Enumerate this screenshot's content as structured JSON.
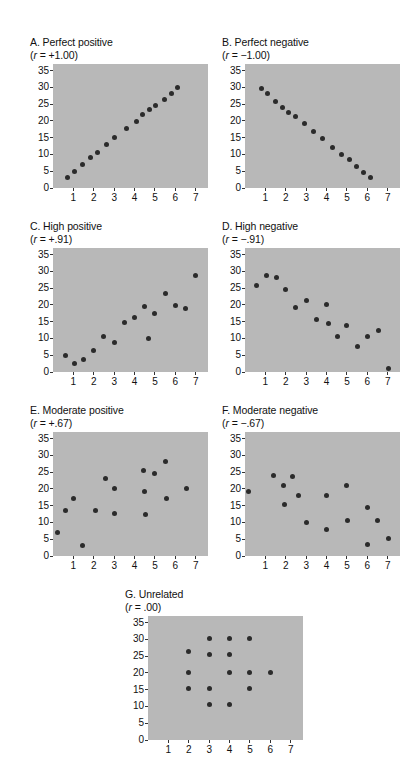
{
  "figure": {
    "background_color": "#ffffff",
    "plot_background_color": "#b8b8b8",
    "dot_color": "#2b2b2b",
    "axis_color": "#333333"
  },
  "chart_data": [
    {
      "type": "scatter",
      "id": "A",
      "title": "A. Perfect positive",
      "subtitle_prefix": "(",
      "subtitle_var": "r",
      "subtitle_rest": " = +1.00)",
      "correlation": "+1.00",
      "xlabel": "",
      "ylabel": "",
      "xlim": [
        0,
        7.6
      ],
      "ylim": [
        0,
        37
      ],
      "xticks": [
        1,
        2,
        3,
        4,
        5,
        6,
        7
      ],
      "yticks": [
        0,
        5,
        10,
        15,
        20,
        25,
        30,
        35
      ],
      "grid": false,
      "points": [
        [
          0.7,
          3.0
        ],
        [
          1.05,
          5.0
        ],
        [
          1.45,
          7.0
        ],
        [
          1.85,
          9.2
        ],
        [
          2.2,
          10.6
        ],
        [
          2.6,
          13.0
        ],
        [
          3.0,
          15.1
        ],
        [
          3.6,
          17.7
        ],
        [
          4.1,
          19.8
        ],
        [
          4.4,
          21.8
        ],
        [
          4.75,
          23.4
        ],
        [
          5.05,
          24.7
        ],
        [
          5.45,
          26.5
        ],
        [
          5.8,
          28.3
        ],
        [
          6.1,
          30.0
        ]
      ]
    },
    {
      "type": "scatter",
      "id": "B",
      "title": "B. Perfect negative",
      "subtitle_prefix": "(",
      "subtitle_var": "r",
      "subtitle_rest": " = −1.00)",
      "correlation": "-1.00",
      "xlabel": "",
      "ylabel": "",
      "xlim": [
        0,
        7.6
      ],
      "ylim": [
        0,
        37
      ],
      "xticks": [
        1,
        2,
        3,
        4,
        5,
        6,
        7
      ],
      "yticks": [
        0,
        5,
        10,
        15,
        20,
        25,
        30,
        35
      ],
      "grid": false,
      "points": [
        [
          0.8,
          29.6
        ],
        [
          1.1,
          28.1
        ],
        [
          1.5,
          25.8
        ],
        [
          1.85,
          24.0
        ],
        [
          2.15,
          22.6
        ],
        [
          2.5,
          21.2
        ],
        [
          2.9,
          19.2
        ],
        [
          3.35,
          16.8
        ],
        [
          3.8,
          14.7
        ],
        [
          4.3,
          12.0
        ],
        [
          4.75,
          10.0
        ],
        [
          5.1,
          8.4
        ],
        [
          5.45,
          6.5
        ],
        [
          5.8,
          4.5
        ],
        [
          6.15,
          3.0
        ]
      ]
    },
    {
      "type": "scatter",
      "id": "C",
      "title": "C. High positive",
      "subtitle_prefix": "(",
      "subtitle_var": "r",
      "subtitle_rest": " = +.91)",
      "correlation": "+.91",
      "xlabel": "",
      "ylabel": "",
      "xlim": [
        0,
        7.6
      ],
      "ylim": [
        0,
        37
      ],
      "xticks": [
        1,
        2,
        3,
        4,
        5,
        6,
        7
      ],
      "yticks": [
        0,
        5,
        10,
        15,
        20,
        25,
        30,
        35
      ],
      "grid": false,
      "points": [
        [
          0.6,
          5.0
        ],
        [
          1.05,
          2.6
        ],
        [
          1.5,
          3.6
        ],
        [
          2.0,
          6.5
        ],
        [
          2.5,
          10.5
        ],
        [
          3.0,
          8.9
        ],
        [
          3.5,
          14.9
        ],
        [
          4.0,
          16.2
        ],
        [
          4.5,
          19.4
        ],
        [
          4.7,
          9.9
        ],
        [
          5.0,
          17.4
        ],
        [
          5.5,
          23.5
        ],
        [
          6.0,
          19.8
        ],
        [
          6.5,
          18.9
        ],
        [
          7.0,
          28.9
        ]
      ]
    },
    {
      "type": "scatter",
      "id": "D",
      "title": "D. High negative",
      "subtitle_prefix": "(",
      "subtitle_var": "r",
      "subtitle_rest": " = −.91)",
      "correlation": "-.91",
      "xlabel": "",
      "ylabel": "",
      "xlim": [
        0,
        7.6
      ],
      "ylim": [
        0,
        37
      ],
      "xticks": [
        1,
        2,
        3,
        4,
        5,
        6,
        7
      ],
      "yticks": [
        0,
        5,
        10,
        15,
        20,
        25,
        30,
        35
      ],
      "grid": false,
      "points": [
        [
          0.55,
          25.9
        ],
        [
          1.05,
          28.9
        ],
        [
          1.55,
          28.3
        ],
        [
          2.0,
          24.7
        ],
        [
          2.5,
          19.3
        ],
        [
          3.0,
          21.4
        ],
        [
          3.5,
          15.8
        ],
        [
          4.0,
          20.1
        ],
        [
          4.1,
          14.5
        ],
        [
          4.55,
          10.6
        ],
        [
          5.0,
          13.8
        ],
        [
          5.5,
          7.6
        ],
        [
          6.0,
          10.7
        ],
        [
          6.55,
          12.4
        ],
        [
          7.05,
          1.0
        ]
      ]
    },
    {
      "type": "scatter",
      "id": "E",
      "title": "E. Moderate positive",
      "subtitle_prefix": "(",
      "subtitle_var": "r",
      "subtitle_rest": " = +.67)",
      "correlation": "+.67",
      "xlabel": "",
      "ylabel": "",
      "xlim": [
        0,
        7.6
      ],
      "ylim": [
        0,
        37
      ],
      "xticks": [
        1,
        2,
        3,
        4,
        5,
        6,
        7
      ],
      "yticks": [
        0,
        5,
        10,
        15,
        20,
        25,
        30,
        35
      ],
      "grid": false,
      "points": [
        [
          0.2,
          6.9
        ],
        [
          0.6,
          13.7
        ],
        [
          1.0,
          17.2
        ],
        [
          1.45,
          3.1
        ],
        [
          2.1,
          13.6
        ],
        [
          2.55,
          23.0
        ],
        [
          3.0,
          20.2
        ],
        [
          3.0,
          12.7
        ],
        [
          4.45,
          25.6
        ],
        [
          4.5,
          19.3
        ],
        [
          4.55,
          12.4
        ],
        [
          5.0,
          24.7
        ],
        [
          5.5,
          28.3
        ],
        [
          5.55,
          17.3
        ],
        [
          6.55,
          20.2
        ]
      ]
    },
    {
      "type": "scatter",
      "id": "F",
      "title": "F. Moderate negative",
      "subtitle_prefix": "(",
      "subtitle_var": "r",
      "subtitle_rest": " = −.67)",
      "correlation": "-.67",
      "xlabel": "",
      "ylabel": "",
      "xlim": [
        0,
        7.6
      ],
      "ylim": [
        0,
        37
      ],
      "xticks": [
        1,
        2,
        3,
        4,
        5,
        6,
        7
      ],
      "yticks": [
        0,
        5,
        10,
        15,
        20,
        25,
        30,
        35
      ],
      "grid": false,
      "points": [
        [
          0.15,
          19.1
        ],
        [
          1.4,
          24.0
        ],
        [
          1.9,
          21.0
        ],
        [
          1.95,
          15.5
        ],
        [
          2.35,
          23.8
        ],
        [
          2.6,
          18.2
        ],
        [
          3.0,
          9.9
        ],
        [
          4.0,
          18.2
        ],
        [
          4.0,
          7.8
        ],
        [
          5.0,
          21.0
        ],
        [
          5.05,
          10.7
        ],
        [
          6.0,
          14.5
        ],
        [
          6.0,
          3.4
        ],
        [
          6.5,
          10.5
        ],
        [
          7.05,
          5.1
        ]
      ]
    },
    {
      "type": "scatter",
      "id": "G",
      "title": "G. Unrelated",
      "subtitle_prefix": "(",
      "subtitle_var": "r",
      "subtitle_rest": " = .00)",
      "correlation": ".00",
      "xlabel": "",
      "ylabel": "",
      "xlim": [
        0,
        7.6
      ],
      "ylim": [
        0,
        37
      ],
      "xticks": [
        1,
        2,
        3,
        4,
        5,
        6,
        7
      ],
      "yticks": [
        0,
        5,
        10,
        15,
        20,
        25,
        30,
        35
      ],
      "grid": false,
      "points": [
        [
          2.0,
          26.3
        ],
        [
          2.0,
          20.1
        ],
        [
          2.0,
          15.4
        ],
        [
          3.0,
          30.2
        ],
        [
          3.0,
          25.5
        ],
        [
          3.0,
          15.4
        ],
        [
          3.0,
          10.7
        ],
        [
          4.0,
          30.2
        ],
        [
          4.0,
          25.5
        ],
        [
          4.0,
          20.1
        ],
        [
          4.0,
          10.7
        ],
        [
          5.0,
          30.2
        ],
        [
          5.0,
          20.1
        ],
        [
          5.0,
          15.4
        ],
        [
          6.0,
          20.1
        ]
      ]
    }
  ]
}
